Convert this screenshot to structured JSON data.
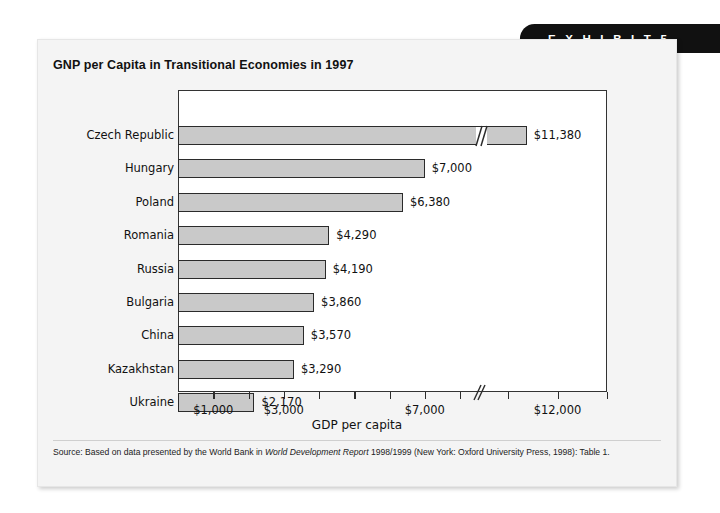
{
  "banner": {
    "label": "E X H I B I T   5"
  },
  "card": {
    "title": "GNP per Capita in Transitional Economies in 1997",
    "source_prefix": "Source: Based on data presented by the World Bank in ",
    "source_italic": "World Development Report",
    "source_suffix": " 1998/1999 (New York: Oxford University Press, 1998): Table 1."
  },
  "chart_data": {
    "type": "bar",
    "orientation": "horizontal",
    "title": "GNP per Capita in Transitional Economies in 1997",
    "xlabel": "GDP per capita",
    "ylabel": "",
    "grid": false,
    "legend": "none",
    "axis_break": true,
    "axis_break_note": "x-axis is broken between roughly $8,000 and $11,000; the Czech Republic bar is also drawn with a break",
    "xlim": [
      0,
      13000
    ],
    "xtick_values": [
      1000,
      2000,
      3000,
      4000,
      5000,
      6000,
      7000,
      8000,
      11000,
      12000,
      13000
    ],
    "xtick_labels": [
      "$1,000",
      "",
      "$3,000",
      "",
      "",
      "",
      "$7,000",
      "",
      "",
      "$12,000",
      ""
    ],
    "categories": [
      "Czech Republic",
      "Hungary",
      "Poland",
      "Romania",
      "Russia",
      "Bulgaria",
      "China",
      "Kazakhstan",
      "Ukraine"
    ],
    "values": [
      11380,
      7000,
      6380,
      4290,
      4190,
      3860,
      3570,
      3290,
      2170
    ],
    "value_labels": [
      "$11,380",
      "$7,000",
      "$6,380",
      "$4,290",
      "$4,190",
      "$3,860",
      "$3,570",
      "$3,290",
      "$2,170"
    ],
    "bar_fill": "#c9c9c9",
    "bar_stroke": "#2b2b2b"
  },
  "colors": {
    "banner_bg": "#111111",
    "banner_text": "#ffffff",
    "card_bg": "#f4f4f4",
    "plot_bg": "#ffffff",
    "axis": "#333333",
    "text": "#111111"
  }
}
